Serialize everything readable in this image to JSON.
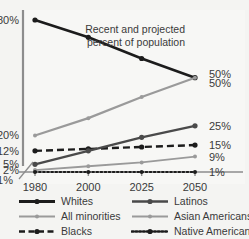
{
  "chart_data": {
    "type": "line",
    "title": "",
    "annotation": "Recent and projected\npercent of population",
    "annotation_line1": "Recent and projected",
    "annotation_line2": "percent of population",
    "xlabel": "",
    "ylabel": "",
    "categories": [
      "1980",
      "2000",
      "2025",
      "2050"
    ],
    "x": [
      1980,
      2000,
      2025,
      2050
    ],
    "ylim": [
      1,
      80
    ],
    "grid": false,
    "axis_break": true,
    "axis_break_label": "1%",
    "left_axis_labels": [
      "80%",
      "20%",
      "12%",
      "5%",
      "2%",
      "1%"
    ],
    "right_axis_labels": [
      "50%",
      "50%",
      "25%",
      "15%",
      "9%",
      "1%"
    ],
    "legend_position": "bottom",
    "series": [
      {
        "name": "Whites",
        "values": [
          80,
          71,
          60,
          50
        ],
        "color": "#1c1c1c",
        "style": "solid",
        "width": 2.6,
        "end_label": "50%"
      },
      {
        "name": "All minorities",
        "values": [
          20,
          29,
          40,
          50
        ],
        "color": "#9a9a9a",
        "style": "solid",
        "width": 2.2,
        "end_label": "50%"
      },
      {
        "name": "Blacks",
        "values": [
          12,
          13,
          14,
          15
        ],
        "color": "#1c1c1c",
        "style": "dashed",
        "width": 2.4,
        "end_label": "15%"
      },
      {
        "name": "Latinos",
        "values": [
          5,
          12,
          19,
          25
        ],
        "color": "#4a4a4a",
        "style": "solid",
        "width": 2.4,
        "end_label": "25%"
      },
      {
        "name": "Asian Americans",
        "values": [
          2,
          4,
          6,
          9
        ],
        "color": "#9a9a9a",
        "style": "solid",
        "width": 1.8,
        "end_label": "9%"
      },
      {
        "name": "Native Americans",
        "values": [
          1,
          1,
          1,
          1
        ],
        "color": "#1c1c1c",
        "style": "dotted",
        "width": 2.2,
        "end_label": "1%"
      }
    ]
  },
  "legend": {
    "items": [
      {
        "label": "Whites",
        "color": "#1c1c1c",
        "style": "solid",
        "width": 3
      },
      {
        "label": "Latinos",
        "color": "#4a4a4a",
        "style": "solid",
        "width": 2.4
      },
      {
        "label": "All minorities",
        "color": "#9a9a9a",
        "style": "solid",
        "width": 2
      },
      {
        "label": "Asian Americans",
        "color": "#9a9a9a",
        "style": "solid",
        "width": 2
      },
      {
        "label": "Blacks",
        "color": "#1c1c1c",
        "style": "dashed",
        "width": 2.6
      },
      {
        "label": "Native Americans",
        "color": "#1c1c1c",
        "style": "dotted",
        "width": 2.6
      }
    ]
  },
  "axes": {
    "x_ticks": [
      "1980",
      "2000",
      "2025",
      "2050"
    ],
    "y_left": [
      {
        "text": "80%",
        "value": 80
      },
      {
        "text": "20%",
        "value": 20
      },
      {
        "text": "12%",
        "value": 12
      },
      {
        "text": "5%",
        "value": 5
      },
      {
        "text": "2%",
        "value": 2
      },
      {
        "text": "1%",
        "value": 1
      }
    ],
    "y_right": [
      {
        "text": "50%",
        "value": 52
      },
      {
        "text": "50%",
        "value": 47
      },
      {
        "text": "25%",
        "value": 25
      },
      {
        "text": "15%",
        "value": 15
      },
      {
        "text": "9%",
        "value": 9
      },
      {
        "text": "1%",
        "value": 1
      }
    ]
  },
  "colors": {
    "background": "#f4f4f2",
    "plot_background": "#f7f7f5",
    "axis": "#8d8d8d",
    "text": "#3a3a3a",
    "dark_series": "#1c1c1c",
    "mid_series": "#4a4a4a",
    "light_series": "#9a9a9a"
  }
}
